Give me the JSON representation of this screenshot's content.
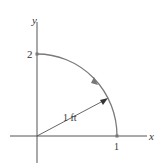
{
  "diagram": {
    "axes": {
      "x_label": "x",
      "y_label": "y"
    },
    "ticks": {
      "x_tick": "1",
      "y_tick": "2"
    },
    "radius_label": "1 ft",
    "arc": {
      "from": [
        0,
        2
      ],
      "to": [
        1,
        0
      ],
      "direction": "counterclockwise"
    },
    "colors": {
      "axis": "#555555",
      "arc": "#7a7a7a",
      "text": "#333333"
    }
  }
}
